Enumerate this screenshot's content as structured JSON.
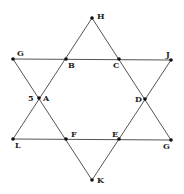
{
  "diagram": {
    "title": "",
    "type": "hexagram",
    "points": [
      {
        "id": "H",
        "label": "H"
      },
      {
        "id": "G1",
        "label": "G"
      },
      {
        "id": "B",
        "label": "B"
      },
      {
        "id": "C",
        "label": "C"
      },
      {
        "id": "J",
        "label": "J"
      },
      {
        "id": "A",
        "label": "A"
      },
      {
        "id": "D",
        "label": "D"
      },
      {
        "id": "L",
        "label": "L"
      },
      {
        "id": "F",
        "label": "F"
      },
      {
        "id": "E",
        "label": "E"
      },
      {
        "id": "G2",
        "label": "G"
      },
      {
        "id": "K",
        "label": "K"
      }
    ],
    "annotations": [
      {
        "near": "A",
        "text": "5"
      }
    ],
    "edges": [
      [
        "H",
        "L"
      ],
      [
        "H",
        "G2"
      ],
      [
        "L",
        "G2"
      ],
      [
        "G1",
        "J"
      ],
      [
        "G1",
        "K"
      ],
      [
        "J",
        "K"
      ]
    ],
    "colors": {
      "line": "#555555",
      "point": "#111111",
      "label": "#222222"
    }
  }
}
